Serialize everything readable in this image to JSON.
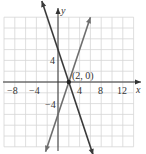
{
  "chart_data": {
    "type": "line",
    "title": "",
    "xlabel": "x",
    "ylabel": "y",
    "xlim": [
      -10,
      14
    ],
    "ylim": [
      -12,
      12
    ],
    "grid": true,
    "grid_step": 2,
    "x_ticks": [
      "-8",
      "-4",
      "4",
      "8",
      "12"
    ],
    "x_tick_values": [
      -8,
      -4,
      4,
      8,
      12
    ],
    "y_ticks": [
      "4",
      "-4"
    ],
    "y_tick_values": [
      4,
      -4
    ],
    "series": [
      {
        "name": "y = -3x + 6",
        "points": [
          [
            -3,
            15
          ],
          [
            6.5,
            -13.5
          ]
        ],
        "color": "#3a3a3a"
      },
      {
        "name": "y = 3x - 6",
        "points": [
          [
            -2.3,
            -12.9
          ],
          [
            6,
            12
          ]
        ],
        "color": "#6e6e6e"
      }
    ],
    "annotations": [
      {
        "text": "(2, 0)",
        "x": 2,
        "y": 0
      }
    ]
  },
  "labels": {
    "x_axis": "x",
    "y_axis": "y",
    "point": "(2, 0)",
    "tick_m8": "−8",
    "tick_m4": "−4",
    "tick_4": "4",
    "tick_8": "8",
    "tick_12": "12",
    "ytick_4": "4",
    "ytick_m4": "−4"
  }
}
